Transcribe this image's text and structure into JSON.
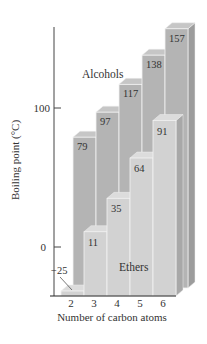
{
  "chart_data": {
    "type": "bar",
    "style": "3d-stepped",
    "title": "",
    "xlabel": "Number of carbon atoms",
    "ylabel": "Boiling point (°C)",
    "categories": [
      "2",
      "3",
      "4",
      "5",
      "6"
    ],
    "yticks": [
      0,
      100
    ],
    "ylim": [
      -25,
      160
    ],
    "grid": false,
    "series": [
      {
        "name": "Alcohols",
        "values": [
          79,
          97,
          117,
          138,
          157
        ],
        "color": "#b4b4b4"
      },
      {
        "name": "Ethers",
        "values": [
          -25,
          11,
          35,
          64,
          91
        ],
        "color": "#d2d2d2"
      }
    ],
    "annotations": [
      "Alcohols",
      "Ethers"
    ]
  },
  "labels": {
    "xlabel": "Number of carbon atoms",
    "ylabel": "Boiling point (°C)",
    "alcohols": "Alcohols",
    "ethers": "Ethers",
    "ytick_0": "0",
    "ytick_100": "100"
  }
}
